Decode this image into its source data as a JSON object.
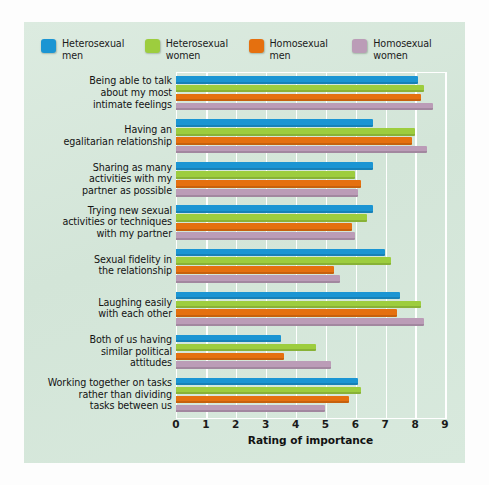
{
  "chart_data": {
    "type": "bar",
    "orientation": "horizontal",
    "title": "",
    "xlabel": "Rating of importance",
    "ylabel": "",
    "xlim": [
      0,
      9
    ],
    "xticks": [
      0,
      1,
      2,
      3,
      4,
      5,
      6,
      7,
      8,
      9
    ],
    "grid": true,
    "legend_position": "top-left",
    "categories": [
      "Being able to talk\nabout my most\nintimate feelings",
      "Having an\negalitarian relationship",
      "Sharing as many\nactivities with my\npartner as possible",
      "Trying new sexual\nactivities or techniques\nwith my partner",
      "Sexual fidelity in\nthe relationship",
      "Laughing easily\nwith each other",
      "Both of us having\nsimilar political\nattitudes",
      "Working together on tasks\nrather than dividing\ntasks between us"
    ],
    "series": [
      {
        "name": "Heterosexual men",
        "color": "#1b95d3",
        "values": [
          8.1,
          6.6,
          6.6,
          6.6,
          7.0,
          7.5,
          3.5,
          6.1
        ]
      },
      {
        "name": "Heterosexual women",
        "color": "#9dcd3e",
        "values": [
          8.3,
          8.0,
          6.0,
          6.4,
          7.2,
          8.2,
          4.7,
          6.2
        ]
      },
      {
        "name": "Homosexual men",
        "color": "#e5700f",
        "values": [
          8.2,
          7.9,
          6.2,
          5.9,
          5.3,
          7.4,
          3.6,
          5.8
        ]
      },
      {
        "name": "Homosexual women",
        "color": "#bb9cb7",
        "values": [
          8.6,
          8.4,
          6.1,
          6.0,
          5.5,
          8.3,
          5.2,
          5.0
        ]
      }
    ]
  },
  "legend": {
    "items": [
      {
        "label": "Heterosexual\nmen",
        "swatch_name": "legend-swatch-heterosexual-men",
        "color": "#1b95d3"
      },
      {
        "label": "Heterosexual\nwomen",
        "swatch_name": "legend-swatch-heterosexual-women",
        "color": "#9dcd3e"
      },
      {
        "label": "Homosexual\nmen",
        "swatch_name": "legend-swatch-homosexual-men",
        "color": "#e5700f"
      },
      {
        "label": "Homosexual\nwomen",
        "swatch_name": "legend-swatch-homosexual-women",
        "color": "#bb9cb7"
      }
    ]
  },
  "axis": {
    "x_title": "Rating of importance",
    "x_tick_labels": [
      "0",
      "1",
      "2",
      "3",
      "4",
      "5",
      "6",
      "7",
      "8",
      "9"
    ]
  },
  "style": {
    "panel_background": "#d7e8dc",
    "page_background": "#fdfdfd",
    "gridline_color": "#ffffff",
    "text_color": "#131313"
  }
}
